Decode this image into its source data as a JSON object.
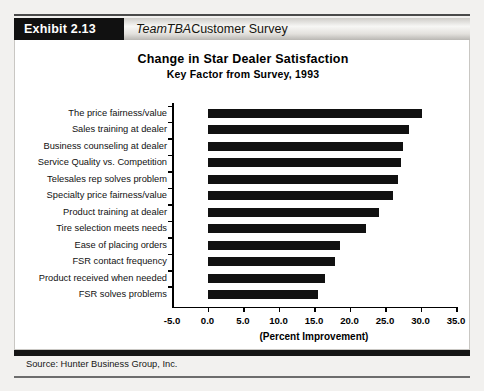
{
  "header": {
    "exhibit_label": "Exhibit 2.13",
    "brand": "TeamTBA",
    "title_rest": " Customer Survey"
  },
  "chart_data": {
    "type": "bar",
    "orientation": "horizontal",
    "title": "Change in Star Dealer Satisfaction",
    "subtitle": "Key Factor from Survey, 1993",
    "xlabel": "(Percent Improvement)",
    "ylabel": "",
    "xlim": [
      -5.0,
      35.0
    ],
    "xticks": [
      "-5.0",
      "0.0",
      "5.0",
      "10.0",
      "15.0",
      "20.0",
      "25.0",
      "30.0",
      "35.0"
    ],
    "xtick_values": [
      -5.0,
      0.0,
      5.0,
      10.0,
      15.0,
      20.0,
      25.0,
      30.0,
      35.0
    ],
    "grid": false,
    "legend": false,
    "categories": [
      "The price fairness/value",
      "Sales training at dealer",
      "Business counseling at dealer",
      "Service Quality vs. Competition",
      "Telesales rep solves problem",
      "Specialty price fairness/value",
      "Product training at dealer",
      "Tire selection meets needs",
      "Ease of placing orders",
      "FSR contact frequency",
      "Product received when needed",
      "FSR solves problems"
    ],
    "values": [
      30.2,
      28.4,
      27.6,
      27.3,
      26.9,
      26.1,
      24.2,
      22.3,
      18.7,
      17.9,
      16.5,
      15.5
    ],
    "bar_color": "#111111"
  },
  "footer": {
    "source": "Source: Hunter Business Group, Inc."
  }
}
